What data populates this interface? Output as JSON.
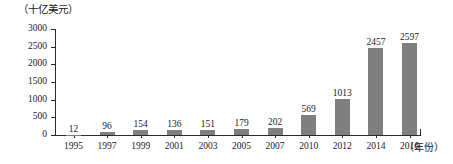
{
  "chart_data": {
    "type": "bar",
    "title": "",
    "subtitle": "",
    "xlabel": "（年份）",
    "ylabel": "（十亿美元）",
    "categories": [
      "1995",
      "1997",
      "1999",
      "2001",
      "2003",
      "2005",
      "2007",
      "2010",
      "2012",
      "2014",
      "2016"
    ],
    "values": [
      12,
      96,
      154,
      136,
      151,
      179,
      202,
      569,
      1013,
      2457,
      2597
    ],
    "value_labels": [
      "12",
      "96",
      "154",
      "136",
      "151",
      "179",
      "202",
      "569",
      "1013",
      "2457",
      "2597"
    ],
    "ylim": [
      0,
      3000
    ],
    "yticks": [
      0,
      500,
      1000,
      1500,
      2000,
      2500,
      3000
    ],
    "ytick_labels": [
      "0",
      "500",
      "1000",
      "1500",
      "2000",
      "2500",
      "3000"
    ],
    "grid": false,
    "legend": null,
    "series_name": "",
    "bar_color": "#7f7f7f",
    "axis_color": "#2b2b2b",
    "text_color": "#1a1a1a"
  }
}
